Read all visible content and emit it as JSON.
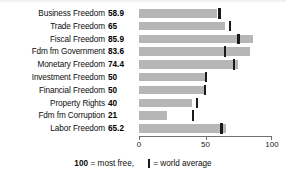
{
  "chart_data": {
    "type": "bar",
    "orientation": "horizontal",
    "title": "",
    "xlabel": "",
    "ylabel": "",
    "xlim": [
      0,
      100
    ],
    "grid": false,
    "categories": [
      "Business Freedom",
      "Trade Freedom",
      "Fiscal Freedom",
      "Fdm fm Government",
      "Monetary Freedom",
      "Investment Freedom",
      "Financial Freedom",
      "Property Rights",
      "Fdm fm Corruption",
      "Labor Freedom"
    ],
    "values": [
      58.9,
      65,
      85.9,
      83.6,
      74.4,
      50,
      50,
      40,
      21,
      65.2
    ],
    "value_labels": [
      "58.9",
      "65",
      "85.9",
      "83.6",
      "74.4",
      "50",
      "50",
      "40",
      "21",
      "65.2"
    ],
    "world_average": [
      60.5,
      68.5,
      74.8,
      64.5,
      71.5,
      50.2,
      49.5,
      43.5,
      40.5,
      62.0
    ],
    "xticks": [
      0,
      50,
      100
    ],
    "xtick_labels": [
      "0",
      "50",
      "100"
    ],
    "series": [
      {
        "name": "score",
        "values": [
          58.9,
          65,
          85.9,
          83.6,
          74.4,
          50,
          50,
          40,
          21,
          65.2
        ]
      },
      {
        "name": "world average",
        "values": [
          60.5,
          68.5,
          74.8,
          64.5,
          71.5,
          50.2,
          49.5,
          43.5,
          40.5,
          62.0
        ]
      }
    ],
    "colors": {
      "bar": "#b6b6b6",
      "average_marker": "#1a1a1a",
      "axis": "#6e6e6e",
      "text": "#0d0d0d"
    }
  },
  "legend": {
    "position": "bottom-center",
    "most_free_number": "100",
    "most_free_text": "= most free,",
    "average_text": "= world average"
  }
}
